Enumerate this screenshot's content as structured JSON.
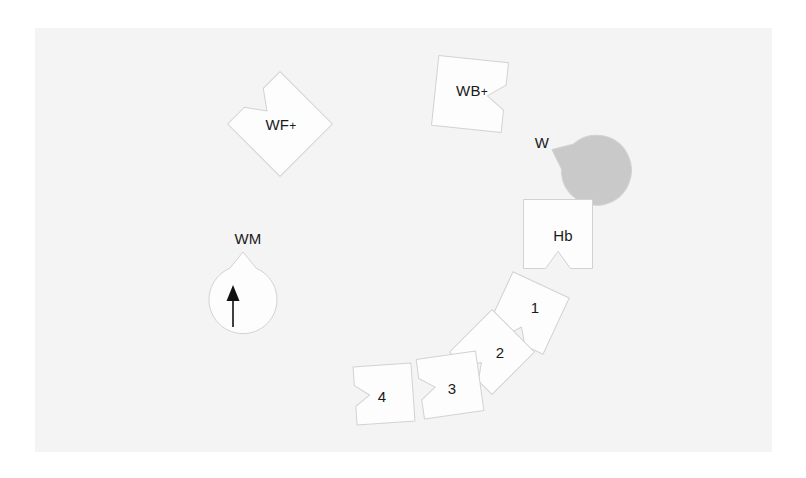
{
  "figure": {
    "panel": {
      "background_color": "#f4f4f4",
      "x": 35,
      "y": 28,
      "width": 737,
      "height": 424
    },
    "canvas_background_color": "#ffffff",
    "piece_outline_color": "#d2d2d2",
    "piece_fill_white": "#fdfdfd",
    "piece_fill_gray": "#c9c9c9",
    "label_color": "#1a1a1a",
    "arrow_color": "#111111"
  },
  "pieces": [
    {
      "id": "wf-plus",
      "label": "WF",
      "superscript": "+",
      "shape": "square-notched",
      "fill": "#fdfdfd",
      "rotation_deg": 45,
      "center_x": 280,
      "center_y": 124,
      "size": 74,
      "label_x": 281,
      "label_y": 124
    },
    {
      "id": "wb-plus",
      "label": "WB",
      "superscript": "+",
      "shape": "square-notched",
      "fill": "#fdfdfd",
      "rotation_deg": 186,
      "center_x": 470,
      "center_y": 94,
      "size": 70,
      "label_x": 472,
      "label_y": 90
    },
    {
      "id": "w",
      "label": "W",
      "superscript": "",
      "shape": "circle-notched",
      "fill": "#c9c9c9",
      "rotation_deg": 205,
      "center_x": 538,
      "center_y": 143,
      "size": 70,
      "label_x": 542,
      "label_y": 142
    },
    {
      "id": "hb",
      "label": "Hb",
      "superscript": "",
      "shape": "square-notched",
      "fill": "#fdfdfd",
      "rotation_deg": 270,
      "center_x": 558,
      "center_y": 234,
      "size": 69,
      "label_x": 563,
      "label_y": 235
    },
    {
      "id": "piece-1",
      "label": "1",
      "superscript": "",
      "shape": "square-notched",
      "fill": "#fdfdfd",
      "rotation_deg": 295,
      "center_x": 528,
      "center_y": 313,
      "size": 62,
      "label_x": 535,
      "label_y": 307
    },
    {
      "id": "piece-2",
      "label": "2",
      "superscript": "",
      "shape": "square-notched",
      "fill": "#fdfdfd",
      "rotation_deg": 315,
      "center_x": 492,
      "center_y": 352,
      "size": 60,
      "label_x": 500,
      "label_y": 352
    },
    {
      "id": "piece-3",
      "label": "3",
      "superscript": "",
      "shape": "square-notched",
      "fill": "#fdfdfd",
      "rotation_deg": 352,
      "center_x": 450,
      "center_y": 385,
      "size": 60,
      "label_x": 452,
      "label_y": 388
    },
    {
      "id": "piece-4",
      "label": "4",
      "superscript": "",
      "shape": "square-notched",
      "fill": "#fdfdfd",
      "rotation_deg": 356,
      "center_x": 384,
      "center_y": 394,
      "size": 58,
      "label_x": 382,
      "label_y": 396
    },
    {
      "id": "wm",
      "label": "WM",
      "superscript": "",
      "shape": "circle-notched",
      "fill": "#fdfdfd",
      "rotation_deg": 270,
      "center_x": 243,
      "center_y": 237,
      "size": 68,
      "label_x": 248,
      "label_y": 238
    }
  ],
  "annotations": {
    "entry_arrow": {
      "name": "entry-arrow",
      "direction": "up",
      "x": 233,
      "tip_y": 285,
      "tail_y": 327,
      "head_width": 13,
      "head_height": 16
    }
  }
}
